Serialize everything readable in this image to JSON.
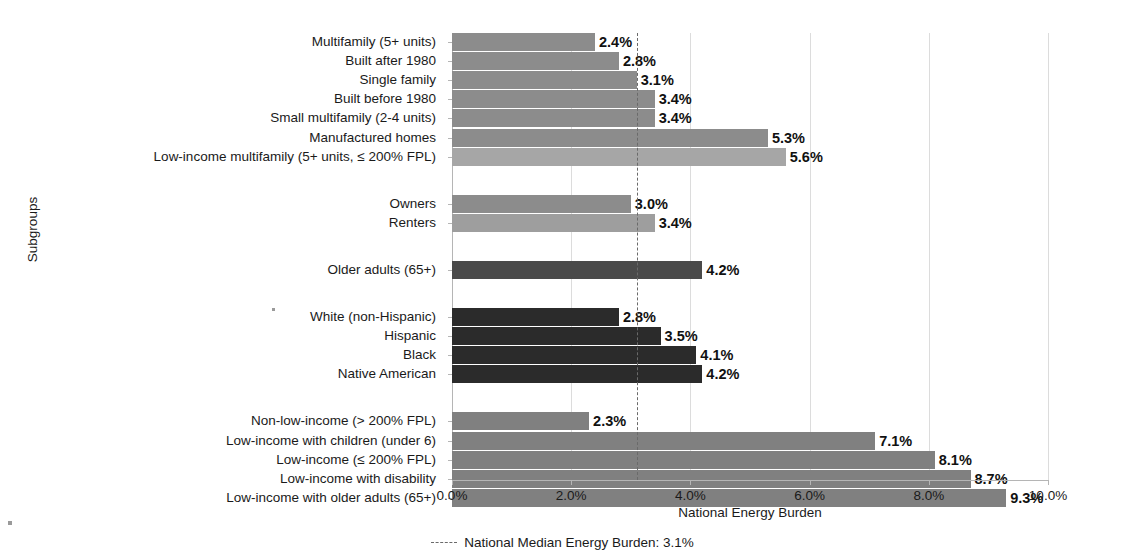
{
  "chart_data": {
    "type": "bar",
    "orientation": "horizontal",
    "title": "",
    "xlabel": "National Energy Burden",
    "ylabel": "Subgroups",
    "xlim": [
      0,
      10
    ],
    "xticks": [
      "0.0%",
      "2.0%",
      "4.0%",
      "6.0%",
      "8.0%",
      "10.0%"
    ],
    "xtick_values": [
      0,
      2,
      4,
      6,
      8,
      10
    ],
    "grid": "vertical-light",
    "legend_position": "bottom-center",
    "value_suffix": "%",
    "reference_line": {
      "label": "National Median Energy Burden: 3.1%",
      "value": 3.1,
      "style": "dashed",
      "color": "#6a6a6a"
    },
    "colors": {
      "housing": "#8c8c8c",
      "housing_highlight": "#a6a6a6",
      "tenure": "#8c8c8c",
      "tenure_light": "#9e9e9e",
      "age": "#4a4a4a",
      "race": "#2b2b2b",
      "income": "#808080"
    },
    "groups": [
      {
        "name": "housing-type",
        "bars": [
          {
            "label": "Multifamily (5+ units)",
            "value": 2.4,
            "value_label": "2.4%",
            "color": "#8c8c8c"
          },
          {
            "label": "Built after 1980",
            "value": 2.8,
            "value_label": "2.8%",
            "color": "#8c8c8c"
          },
          {
            "label": "Single family",
            "value": 3.1,
            "value_label": "3.1%",
            "color": "#8c8c8c"
          },
          {
            "label": "Built before 1980",
            "value": 3.4,
            "value_label": "3.4%",
            "color": "#8c8c8c"
          },
          {
            "label": "Small multifamily (2-4 units)",
            "value": 3.4,
            "value_label": "3.4%",
            "color": "#8c8c8c"
          },
          {
            "label": "Manufactured homes",
            "value": 5.3,
            "value_label": "5.3%",
            "color": "#8c8c8c"
          },
          {
            "label": "Low-income multifamily (5+ units, ≤ 200% FPL)",
            "value": 5.6,
            "value_label": "5.6%",
            "color": "#a6a6a6"
          }
        ]
      },
      {
        "name": "tenure",
        "bars": [
          {
            "label": "Owners",
            "value": 3.0,
            "value_label": "3.0%",
            "color": "#8c8c8c"
          },
          {
            "label": "Renters",
            "value": 3.4,
            "value_label": "3.4%",
            "color": "#9e9e9e"
          }
        ]
      },
      {
        "name": "age",
        "bars": [
          {
            "label": "Older adults (65+)",
            "value": 4.2,
            "value_label": "4.2%",
            "color": "#4a4a4a"
          }
        ]
      },
      {
        "name": "race-ethnicity",
        "bars": [
          {
            "label": "White (non-Hispanic)",
            "value": 2.8,
            "value_label": "2.8%",
            "color": "#2b2b2b"
          },
          {
            "label": "Hispanic",
            "value": 3.5,
            "value_label": "3.5%",
            "color": "#2b2b2b"
          },
          {
            "label": "Black",
            "value": 4.1,
            "value_label": "4.1%",
            "color": "#2b2b2b"
          },
          {
            "label": "Native American",
            "value": 4.2,
            "value_label": "4.2%",
            "color": "#2b2b2b"
          }
        ]
      },
      {
        "name": "income",
        "bars": [
          {
            "label": "Non-low-income (> 200% FPL)",
            "value": 2.3,
            "value_label": "2.3%",
            "color": "#808080"
          },
          {
            "label": "Low-income with children (under 6)",
            "value": 7.1,
            "value_label": "7.1%",
            "color": "#808080"
          },
          {
            "label": "Low-income (≤ 200% FPL)",
            "value": 8.1,
            "value_label": "8.1%",
            "color": "#808080"
          },
          {
            "label": "Low-income with disability",
            "value": 8.7,
            "value_label": "8.7%",
            "color": "#808080"
          },
          {
            "label": "Low-income with older adults (65+)",
            "value": 9.3,
            "value_label": "9.3%",
            "color": "#808080"
          }
        ]
      }
    ]
  }
}
